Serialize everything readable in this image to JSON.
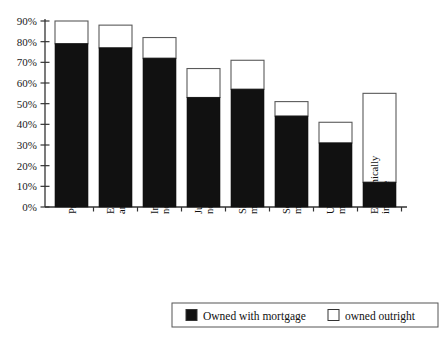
{
  "chart_data": {
    "type": "bar",
    "subtype": "stacked-bar",
    "title": "",
    "xlabel": "",
    "ylabel": "",
    "ylim": [
      0,
      90
    ],
    "ytick_labels": [
      "0%",
      "10%",
      "20%",
      "30%",
      "40%",
      "50%",
      "60%",
      "70%",
      "80%",
      "90%"
    ],
    "ytick_values": [
      0,
      10,
      20,
      30,
      40,
      50,
      60,
      70,
      80,
      90
    ],
    "grid": false,
    "legend_position": "bottom",
    "categories": [
      "Professional",
      "Employers\nand managers",
      "Intermediate\nnon-manual",
      "Junior\nnon-manual",
      "Skilled\nmanual",
      "Semi-skilled\nmanual",
      "Unskilled\nmanual",
      "Economically\ninactive"
    ],
    "category_lines": [
      [
        "Professional"
      ],
      [
        "Employers",
        "and managers"
      ],
      [
        "Intermediate",
        "non-manual"
      ],
      [
        "Junior",
        "non-manual"
      ],
      [
        "Skilled",
        "manual"
      ],
      [
        "Semi-skilled",
        "manual"
      ],
      [
        "Unskilled",
        "manual"
      ],
      [
        "Economically",
        "inactive"
      ]
    ],
    "series": [
      {
        "name": "Owned with mortgage",
        "color": "#111111",
        "values": [
          79,
          77,
          72,
          53,
          57,
          44,
          31,
          12
        ]
      },
      {
        "name": "owned outright",
        "color": "#ffffff",
        "values": [
          11,
          11,
          10,
          14,
          14,
          7,
          10,
          43
        ]
      }
    ],
    "totals": [
      90,
      88,
      82,
      67,
      71,
      51,
      41,
      55
    ]
  },
  "legend": {
    "items": [
      {
        "label": "Owned with mortgage",
        "swatch": "#111111"
      },
      {
        "label": "owned outright",
        "swatch": "#ffffff"
      }
    ]
  },
  "colors": {
    "mortgage": "#111111",
    "outright": "#ffffff",
    "axis": "#333333",
    "outline": "#5a5a5a",
    "background": "#ffffff"
  }
}
